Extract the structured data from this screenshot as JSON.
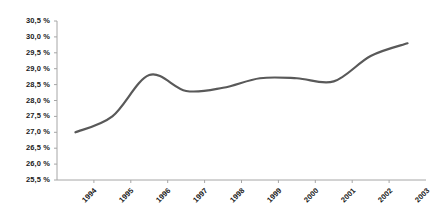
{
  "chart_data": {
    "type": "line",
    "title": "",
    "subtitle": "",
    "xlabel": "",
    "ylabel": "",
    "categories": [
      "1994",
      "1995",
      "1996",
      "1997",
      "1998",
      "1999",
      "2000",
      "2001",
      "2002",
      "2003"
    ],
    "series": [
      {
        "name": "",
        "values": [
          27.0,
          27.5,
          28.8,
          28.3,
          28.4,
          28.7,
          28.7,
          28.6,
          29.4,
          29.8
        ]
      }
    ],
    "values": [
      27.0,
      27.5,
      28.8,
      28.3,
      28.4,
      28.7,
      28.7,
      28.6,
      29.4,
      29.8
    ],
    "ylim": [
      25.5,
      30.5
    ],
    "ytick_step": 0.5,
    "ytick_labels": [
      "30,5 %",
      "30,0 %",
      "29,5 %",
      "29,0 %",
      "28,5 %",
      "28,0 %",
      "27,5 %",
      "27,0 %",
      "26,5 %",
      "26,0 %",
      "25,5 %"
    ],
    "ytick_values": [
      30.5,
      30.0,
      29.5,
      29.0,
      28.5,
      28.0,
      27.5,
      27.0,
      26.5,
      26.0,
      25.5
    ],
    "xtick_labels": [
      "1994",
      "1995",
      "1996",
      "1997",
      "1998",
      "1999",
      "2000",
      "2001",
      "2002",
      "2003"
    ],
    "grid": false,
    "legend": false,
    "legend_position": "none",
    "line_color": "#595959",
    "axis_color": "#a6a6a6",
    "text_color": "#1a1a1a",
    "background_color": "#ffffff",
    "smoothing": "spline",
    "markers": false,
    "line_width": 2.2,
    "annotations": []
  },
  "layout": {
    "plot_left": 57,
    "plot_right": 426,
    "plot_top": 21,
    "plot_bottom": 180
  }
}
